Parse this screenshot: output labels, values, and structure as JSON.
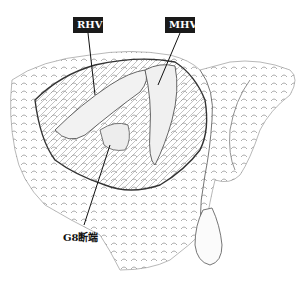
{
  "figure": {
    "labels": [
      {
        "id": "rhv",
        "text": "RHV",
        "style": "boxed"
      },
      {
        "id": "mhv",
        "text": "MHV",
        "style": "boxed"
      },
      {
        "id": "g8",
        "text": "G8断端",
        "style": "plain"
      }
    ]
  }
}
